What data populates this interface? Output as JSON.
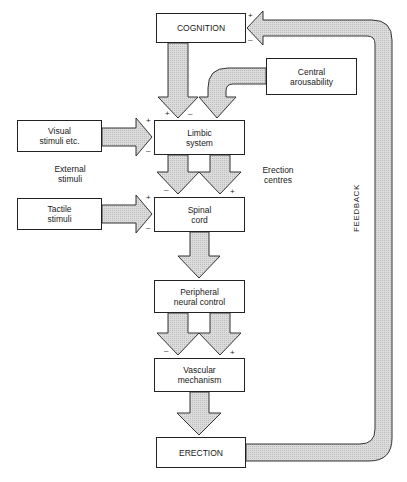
{
  "diagram": {
    "nodes": {
      "cognition": {
        "label": "COGNITION"
      },
      "central_arousability": {
        "line1": "Central",
        "line2": "arousability"
      },
      "visual_stimuli": {
        "line1": "Visual",
        "line2": "stimuli etc."
      },
      "limbic_system": {
        "line1": "Limbic",
        "line2": "system"
      },
      "tactile_stimuli": {
        "line1": "Tactile",
        "line2": "stimuli"
      },
      "spinal_cord": {
        "line1": "Spinal",
        "line2": "cord"
      },
      "peripheral_neural_control": {
        "line1": "Peripheral",
        "line2": "neural control"
      },
      "vascular_mechanism": {
        "line1": "Vascular",
        "line2": "mechanism"
      },
      "erection": {
        "label": "ERECTION"
      }
    },
    "labels": {
      "external_stimuli": {
        "line1": "External",
        "line2": "stimuli"
      },
      "erection_centres": {
        "line1": "Erection",
        "line2": "centres"
      },
      "feedback": "FEEDBACK"
    },
    "signs": {
      "plus": "+",
      "minus": "–"
    },
    "edges": [
      {
        "from": "cognition",
        "to": "limbic_system",
        "signs": "+/-"
      },
      {
        "from": "central_arousability",
        "to": "limbic_system"
      },
      {
        "from": "visual_stimuli",
        "to": "limbic_system",
        "signs": "+/-"
      },
      {
        "from": "limbic_system",
        "to": "spinal_cord",
        "signs": "-"
      },
      {
        "from": "limbic_system",
        "to": "spinal_cord",
        "signs": "+"
      },
      {
        "from": "tactile_stimuli",
        "to": "spinal_cord",
        "signs": "+/-"
      },
      {
        "from": "spinal_cord",
        "to": "peripheral_neural_control"
      },
      {
        "from": "peripheral_neural_control",
        "to": "vascular_mechanism",
        "signs": "-"
      },
      {
        "from": "peripheral_neural_control",
        "to": "vascular_mechanism",
        "signs": "+"
      },
      {
        "from": "vascular_mechanism",
        "to": "erection"
      },
      {
        "from": "erection",
        "to": "cognition",
        "label": "FEEDBACK",
        "signs": "+/-"
      }
    ],
    "colors": {
      "arrow_fill": "#d4d4d4",
      "arrow_stroke": "#333333",
      "box_border": "#222222"
    }
  }
}
